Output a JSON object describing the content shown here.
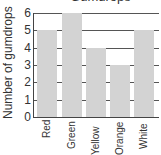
{
  "chart_data": {
    "type": "bar",
    "title": "Gumdrops",
    "xlabel": "",
    "ylabel": "Number of gumdrops",
    "categories": [
      "Red",
      "Green",
      "Yellow",
      "Orange",
      "White"
    ],
    "values": [
      5,
      6,
      4,
      3,
      5
    ],
    "ylim": [
      0,
      6
    ],
    "yticks": [
      "0",
      "1",
      "2",
      "3",
      "4",
      "5",
      "6"
    ],
    "grid": true,
    "bar_color": "#d3d3d3"
  }
}
